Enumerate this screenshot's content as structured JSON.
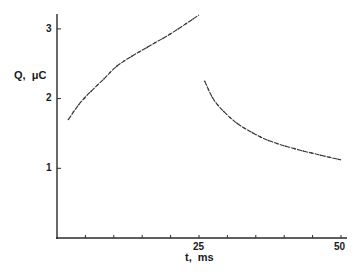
{
  "chart_data": {
    "type": "line",
    "title": "",
    "xlabel": "t, ms",
    "ylabel": "Q, μC",
    "xlim": [
      0,
      50
    ],
    "ylim": [
      0,
      3.3
    ],
    "x_ticks": [
      5,
      10,
      15,
      20,
      25,
      30,
      35,
      40,
      45,
      50
    ],
    "x_tick_labels": [
      {
        "value": 25,
        "label": "25"
      },
      {
        "value": 50,
        "label": "50"
      }
    ],
    "y_ticks": [
      1,
      2,
      3
    ],
    "y_tick_labels": [
      {
        "value": 1,
        "label": "1"
      },
      {
        "value": 2,
        "label": "2"
      },
      {
        "value": 3,
        "label": "3"
      }
    ],
    "grid": false,
    "legend": null,
    "series": [
      {
        "name": "charging",
        "x": [
          2,
          4.4,
          8.1,
          11.1,
          16.4,
          20,
          25
        ],
        "y": [
          1.7,
          1.97,
          2.27,
          2.5,
          2.76,
          2.93,
          3.2
        ]
      },
      {
        "name": "discharging",
        "x": [
          26,
          27.8,
          31,
          34,
          37.5,
          42.8,
          50
        ],
        "y": [
          2.25,
          1.96,
          1.69,
          1.53,
          1.39,
          1.26,
          1.12
        ]
      }
    ]
  },
  "axes": {
    "xlabel": "t,  ms",
    "ylabel": "Q,  μC",
    "y_tick_1": "1",
    "y_tick_2": "2",
    "y_tick_3": "3",
    "x_tick_25": "25",
    "x_tick_50": "50"
  },
  "colors": {
    "axis": "#2a2a2a",
    "curve": "#333333",
    "background": "#ffffff"
  }
}
